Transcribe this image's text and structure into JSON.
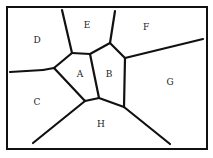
{
  "diagram": {
    "type": "voronoi-partition",
    "frame": {
      "x": 7,
      "y": 7,
      "width": 200,
      "height": 142
    },
    "regions": [
      {
        "id": "A",
        "label": "A",
        "x": 80,
        "y": 77
      },
      {
        "id": "B",
        "label": "B",
        "x": 109,
        "y": 77
      },
      {
        "id": "C",
        "label": "C",
        "x": 37,
        "y": 105
      },
      {
        "id": "D",
        "label": "D",
        "x": 37,
        "y": 43
      },
      {
        "id": "E",
        "label": "E",
        "x": 87,
        "y": 28
      },
      {
        "id": "F",
        "label": "F",
        "x": 146,
        "y": 30
      },
      {
        "id": "G",
        "label": "G",
        "x": 170,
        "y": 85
      },
      {
        "id": "H",
        "label": "H",
        "x": 101,
        "y": 127
      }
    ],
    "edges": [
      [
        [
          62,
          10
        ],
        [
          72,
          53
        ]
      ],
      [
        [
          115,
          11
        ],
        [
          110,
          43
        ]
      ],
      [
        [
          72,
          53
        ],
        [
          90,
          54
        ]
      ],
      [
        [
          90,
          54
        ],
        [
          110,
          43
        ]
      ],
      [
        [
          110,
          43
        ],
        [
          125,
          58
        ]
      ],
      [
        [
          125,
          58
        ],
        [
          203,
          39
        ]
      ],
      [
        [
          10,
          72
        ],
        [
          43,
          70
        ]
      ],
      [
        [
          43,
          70
        ],
        [
          54,
          68
        ]
      ],
      [
        [
          54,
          68
        ],
        [
          72,
          53
        ]
      ],
      [
        [
          54,
          68
        ],
        [
          85,
          101
        ]
      ],
      [
        [
          90,
          54
        ],
        [
          99,
          98
        ]
      ],
      [
        [
          85,
          101
        ],
        [
          99,
          98
        ]
      ],
      [
        [
          125,
          58
        ],
        [
          124,
          107
        ]
      ],
      [
        [
          99,
          98
        ],
        [
          124,
          107
        ]
      ],
      [
        [
          85,
          101
        ],
        [
          33,
          143
        ]
      ],
      [
        [
          124,
          107
        ],
        [
          170,
          144
        ]
      ]
    ],
    "colors": {
      "line": "#111111",
      "background": "#ffffff"
    }
  }
}
